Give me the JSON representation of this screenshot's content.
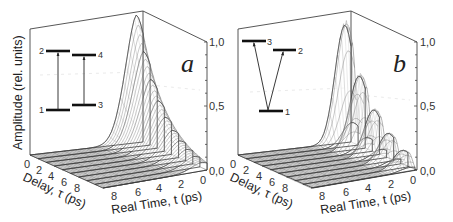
{
  "figure": {
    "panels": [
      {
        "letter": "a",
        "y_axis_label": "Amplitude (rel. units)",
        "delay_axis_label": "Delay, τ (ps)",
        "time_axis_label": "Real Time, t (ps)",
        "z_ticks": [
          "0,0",
          "0,5",
          "1,0"
        ],
        "delay_ticks": [
          "0",
          "2",
          "4",
          "6",
          "8"
        ],
        "time_ticks": [
          "8",
          "6",
          "4",
          "2",
          "0"
        ],
        "inset": {
          "type": "two-independent-two-level-systems",
          "levels": [
            {
              "label": "2",
              "role": "upper-left"
            },
            {
              "label": "4",
              "role": "upper-right"
            },
            {
              "label": "1",
              "role": "lower-left"
            },
            {
              "label": "3",
              "role": "lower-right"
            }
          ],
          "transitions": [
            [
              "1",
              "2"
            ],
            [
              "3",
              "4"
            ]
          ]
        }
      },
      {
        "letter": "b",
        "y_axis_label": "",
        "delay_axis_label": "Delay, τ (ps)",
        "time_axis_label": "Real Time, t (ps)",
        "z_ticks": [
          "0,0",
          "0,5",
          "1,0"
        ],
        "delay_ticks": [
          "0",
          "2",
          "4",
          "6",
          "8"
        ],
        "time_ticks": [
          "8",
          "6",
          "4",
          "2",
          "0"
        ],
        "inset": {
          "type": "V-type-three-level-system",
          "levels": [
            {
              "label": "3",
              "role": "upper-left"
            },
            {
              "label": "2",
              "role": "upper-right"
            },
            {
              "label": "1",
              "role": "ground"
            }
          ],
          "transitions": [
            [
              "1",
              "3"
            ],
            [
              "1",
              "2"
            ]
          ]
        }
      }
    ]
  },
  "chart_data": [
    {
      "type": "surface-waterfall",
      "panel": "a",
      "title": "",
      "xlabel": "Real Time, t (ps)",
      "ylabel": "Delay, τ (ps)",
      "zlabel": "Amplitude (rel. units)",
      "xlim": [
        0,
        9
      ],
      "ylim": [
        0,
        9
      ],
      "zlim": [
        0,
        1.0
      ],
      "z_ticks": [
        0.0,
        0.5,
        1.0
      ],
      "description": "Smooth monotonic decay of signal amplitude with delay; peak ~1.0 at tau=0, t~0, decaying with both t and tau, no oscillation.",
      "delay_slices": [
        0,
        1,
        2,
        3,
        4,
        5,
        6,
        7,
        8,
        9
      ],
      "peak_amplitude_per_slice": [
        1.0,
        0.82,
        0.65,
        0.5,
        0.38,
        0.28,
        0.2,
        0.14,
        0.09,
        0.06
      ]
    },
    {
      "type": "surface-waterfall",
      "panel": "b",
      "title": "",
      "xlabel": "Real Time, t (ps)",
      "ylabel": "Delay, τ (ps)",
      "zlabel": "Amplitude (rel. units)",
      "xlim": [
        0,
        9
      ],
      "ylim": [
        0,
        9
      ],
      "zlim": [
        0,
        1.0
      ],
      "z_ticks": [
        0.0,
        0.5,
        1.0
      ],
      "description": "Decaying amplitude with quantum-beat modulation along delay; separate peaks with decreasing heights.",
      "beat_peaks_tau": [
        0.3,
        2.2,
        4.2,
        6.2,
        8.2
      ],
      "beat_peak_heights": [
        1.0,
        0.58,
        0.42,
        0.25,
        0.13
      ]
    }
  ]
}
